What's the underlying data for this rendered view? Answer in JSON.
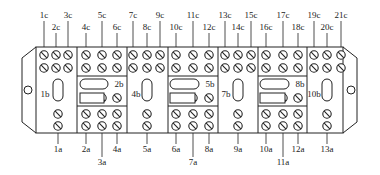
{
  "diagram": {
    "type": "terminal-block-wiring",
    "colors": {
      "line": "#222222",
      "background": "#ffffff",
      "text": "#222222"
    },
    "top_labels": [
      {
        "id": "1c",
        "x": 44,
        "row": "high"
      },
      {
        "id": "2c",
        "x": 56,
        "row": "low"
      },
      {
        "id": "3c",
        "x": 68,
        "row": "high"
      },
      {
        "id": "4c",
        "x": 86,
        "row": "low"
      },
      {
        "id": "5c",
        "x": 102,
        "row": "high"
      },
      {
        "id": "6c",
        "x": 117,
        "row": "low"
      },
      {
        "id": "7c",
        "x": 133,
        "row": "high"
      },
      {
        "id": "8c",
        "x": 147,
        "row": "low"
      },
      {
        "id": "9c",
        "x": 160,
        "row": "high"
      },
      {
        "id": "10c",
        "x": 176,
        "row": "low"
      },
      {
        "id": "11c",
        "x": 193,
        "row": "high"
      },
      {
        "id": "12c",
        "x": 209,
        "row": "low"
      },
      {
        "id": "13c",
        "x": 225,
        "row": "high"
      },
      {
        "id": "14c",
        "x": 238,
        "row": "low"
      },
      {
        "id": "15c",
        "x": 251,
        "row": "high"
      },
      {
        "id": "16c",
        "x": 266,
        "row": "low"
      },
      {
        "id": "17c",
        "x": 283,
        "row": "high"
      },
      {
        "id": "18c",
        "x": 298,
        "row": "low"
      },
      {
        "id": "19c",
        "x": 314,
        "row": "high"
      },
      {
        "id": "20c",
        "x": 327,
        "row": "low"
      },
      {
        "id": "21c",
        "x": 341,
        "row": "high"
      }
    ],
    "bottom_labels": [
      {
        "id": "1a",
        "x": 58,
        "row": "high"
      },
      {
        "id": "2a",
        "x": 86,
        "row": "high"
      },
      {
        "id": "3a",
        "x": 102,
        "row": "low"
      },
      {
        "id": "4a",
        "x": 117,
        "row": "high"
      },
      {
        "id": "5a",
        "x": 147,
        "row": "high"
      },
      {
        "id": "6a",
        "x": 176,
        "row": "high"
      },
      {
        "id": "7a",
        "x": 193,
        "row": "low"
      },
      {
        "id": "8a",
        "x": 209,
        "row": "high"
      },
      {
        "id": "9a",
        "x": 238,
        "row": "high"
      },
      {
        "id": "10a",
        "x": 266,
        "row": "high"
      },
      {
        "id": "11a",
        "x": 283,
        "row": "low"
      },
      {
        "id": "12a",
        "x": 298,
        "row": "high"
      },
      {
        "id": "13a",
        "x": 327,
        "row": "high"
      }
    ],
    "side_labels": [
      {
        "id": "1b",
        "x": 45,
        "y": 94
      },
      {
        "id": "2b",
        "x": 119,
        "y": 84
      },
      {
        "id": "3b",
        "x": 89,
        "y": 99
      },
      {
        "id": "4b",
        "x": 136,
        "y": 94
      },
      {
        "id": "5b",
        "x": 210,
        "y": 84
      },
      {
        "id": "6b",
        "x": 180,
        "y": 99
      },
      {
        "id": "7b",
        "x": 226,
        "y": 94
      },
      {
        "id": "8b",
        "x": 300,
        "y": 84
      },
      {
        "id": "9b",
        "x": 270,
        "y": 99
      },
      {
        "id": "10b",
        "x": 314,
        "y": 94
      }
    ]
  }
}
